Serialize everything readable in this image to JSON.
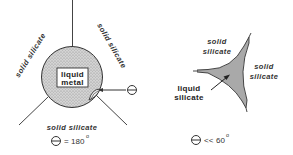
{
  "panels": [
    {
      "id": "non-wetting",
      "labels": {
        "top_left": "solid silicate",
        "top_right": "solid silicate",
        "bottom": "solid silicate",
        "center_line1": "liquid",
        "center_line2": "metal"
      },
      "angle": {
        "symbol": "theta-icon",
        "relation": "=",
        "value": "180",
        "unit": "o"
      },
      "fill_color": "#c8c8c8"
    },
    {
      "id": "wetting",
      "labels": {
        "top_left_line1": "solid",
        "top_left_line2": "silicate",
        "right_line1": "solid",
        "right_line2": "silicate",
        "pointer_line1": "liquid",
        "pointer_line2": "silicate"
      },
      "angle": {
        "symbol": "theta-icon",
        "relation": "<<",
        "value": "60",
        "unit": "o"
      },
      "fill_color": "#a9a9a9"
    }
  ]
}
